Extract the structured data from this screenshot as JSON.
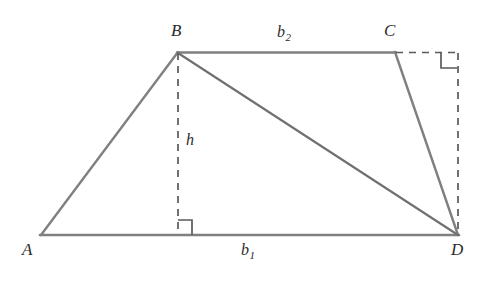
{
  "figure": {
    "type": "geometry-diagram",
    "shape": "trapezoid-with-diagonal",
    "background_color": "#ffffff",
    "stroke_color": "#808080",
    "dash_color": "#5a5a5a",
    "text_color": "#2b2b2b"
  },
  "vertices": [
    {
      "id": "A",
      "label": "A",
      "x": 41,
      "y": 235,
      "label_x": 22,
      "label_y": 241
    },
    {
      "id": "B",
      "label": "B",
      "x": 178,
      "y": 52,
      "label_x": 171,
      "label_y": 22
    },
    {
      "id": "C",
      "label": "C",
      "x": 395,
      "y": 52,
      "label_x": 384,
      "label_y": 22
    },
    {
      "id": "D",
      "label": "D",
      "x": 458,
      "y": 235,
      "label_x": 451,
      "label_y": 241
    }
  ],
  "solid_edges": [
    {
      "name": "edge-AB",
      "x1": 41,
      "y1": 235,
      "x2": 178,
      "y2": 52
    },
    {
      "name": "edge-BC",
      "x1": 178,
      "y1": 52,
      "x2": 395,
      "y2": 52
    },
    {
      "name": "edge-CD",
      "x1": 395,
      "y1": 52,
      "x2": 458,
      "y2": 235
    },
    {
      "name": "edge-AD",
      "x1": 41,
      "y1": 235,
      "x2": 458,
      "y2": 235
    },
    {
      "name": "diagonal-BD",
      "x1": 178,
      "y1": 52,
      "x2": 458,
      "y2": 235
    }
  ],
  "dashed_edges": [
    {
      "name": "altitude-h",
      "x1": 178,
      "y1": 52,
      "x2": 178,
      "y2": 235
    },
    {
      "name": "extension-C-right",
      "x1": 395,
      "y1": 52,
      "x2": 459,
      "y2": 52
    },
    {
      "name": "extension-right-vertical",
      "x1": 458,
      "y1": 52,
      "x2": 458,
      "y2": 235
    }
  ],
  "right_angle_markers": [
    {
      "name": "right-angle-base",
      "points": "178,220 192,220 192,235"
    },
    {
      "name": "right-angle-corner",
      "points": "441,52 441,68 457,68"
    }
  ],
  "measures": [
    {
      "id": "b1",
      "base": "b",
      "sub": "1",
      "x": 241,
      "y": 242,
      "edge": "AD"
    },
    {
      "id": "b2",
      "base": "b",
      "sub": "2",
      "x": 277,
      "y": 24,
      "edge": "BC"
    },
    {
      "id": "h",
      "base": "h",
      "sub": "",
      "x": 186,
      "y": 132,
      "edge": "altitude"
    }
  ]
}
